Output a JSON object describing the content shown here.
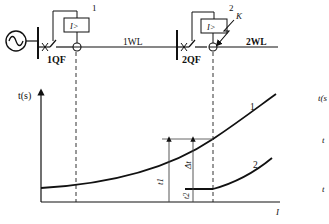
{
  "diagram": {
    "circuit": {
      "source_symbol": "ac-source",
      "breaker_1": "1QF",
      "breaker_2": "2QF",
      "line_1": "1WL",
      "line_2": "2WL",
      "relay_1_number": "1",
      "relay_2_number": "2",
      "relay_label": "I>",
      "fault_point": "K"
    },
    "graph": {
      "y_axis_label": "t(s)",
      "x_axis_label": "I",
      "curve_1_label": "1",
      "curve_2_label": "2",
      "t1_label": "t1",
      "t2_label": "t2",
      "delta_t_label": "Δt"
    },
    "cropped_right_labels": {
      "y_label": "t(s",
      "t_a": "t",
      "t_b": "t"
    }
  },
  "colors": {
    "line": "#111111",
    "background": "#ffffff",
    "guide": "#555555"
  }
}
